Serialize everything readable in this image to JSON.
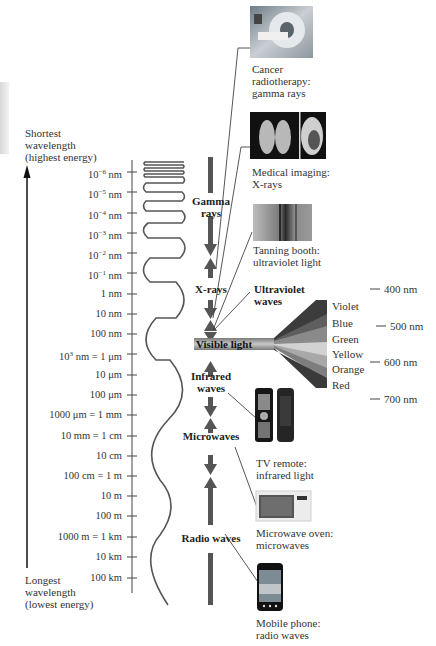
{
  "diagram": {
    "axis": {
      "top_label": [
        "Shortest",
        "wavelength",
        "(highest energy)"
      ],
      "bottom_label": [
        "Longest",
        "wavelength",
        "(lowest energy)"
      ],
      "ticks": [
        {
          "base": "10",
          "exp": "−6",
          "unit": " nm",
          "y": 172
        },
        {
          "base": "10",
          "exp": "−5",
          "unit": " nm",
          "y": 192
        },
        {
          "base": "10",
          "exp": "−4",
          "unit": " nm",
          "y": 213
        },
        {
          "base": "10",
          "exp": "−3",
          "unit": " nm",
          "y": 233
        },
        {
          "base": "10",
          "exp": "−2",
          "unit": " nm",
          "y": 253
        },
        {
          "base": "10",
          "exp": "−1",
          "unit": " nm",
          "y": 273
        },
        {
          "base": "1 nm",
          "exp": "",
          "unit": "",
          "y": 294
        },
        {
          "base": "10 nm",
          "exp": "",
          "unit": "",
          "y": 314
        },
        {
          "base": "100 nm",
          "exp": "",
          "unit": "",
          "y": 334
        },
        {
          "base": "10",
          "exp": "3",
          "unit": " nm = 1 μm",
          "y": 354
        },
        {
          "base": "10 μm",
          "exp": "",
          "unit": "",
          "y": 375
        },
        {
          "base": "100 μm",
          "exp": "",
          "unit": "",
          "y": 395
        },
        {
          "base": "1000 μm = 1 mm",
          "exp": "",
          "unit": "",
          "y": 415
        },
        {
          "base": "10 mm = 1 cm",
          "exp": "",
          "unit": "",
          "y": 436
        },
        {
          "base": "10 cm",
          "exp": "",
          "unit": "",
          "y": 456
        },
        {
          "base": "100 cm = 1 m",
          "exp": "",
          "unit": "",
          "y": 476
        },
        {
          "base": "10 m",
          "exp": "",
          "unit": "",
          "y": 496
        },
        {
          "base": "100 m",
          "exp": "",
          "unit": "",
          "y": 516
        },
        {
          "base": "1000 m = 1 km",
          "exp": "",
          "unit": "",
          "y": 537
        },
        {
          "base": "10 km",
          "exp": "",
          "unit": "",
          "y": 557
        },
        {
          "base": "100 km",
          "exp": "",
          "unit": "",
          "y": 578
        }
      ]
    },
    "bands": [
      {
        "name": "Gamma rays",
        "lines": [
          "Gamma",
          "rays"
        ]
      },
      {
        "name": "X-rays",
        "lines": [
          "X-rays"
        ]
      },
      {
        "name": "Ultraviolet waves",
        "lines": [
          "Ultraviolet",
          "waves"
        ]
      },
      {
        "name": "Visible light",
        "lines": [
          "Visible light"
        ]
      },
      {
        "name": "Infrared waves",
        "lines": [
          "Infrared",
          "waves"
        ]
      },
      {
        "name": "Microwaves",
        "lines": [
          "Microwaves"
        ]
      },
      {
        "name": "Radio waves",
        "lines": [
          "Radio waves"
        ]
      }
    ],
    "visible_spectrum": {
      "colors": [
        "Violet",
        "Blue",
        "Green",
        "Yellow",
        "Orange",
        "Red"
      ],
      "wavelength_marks": [
        "400 nm",
        "500 nm",
        "600 nm",
        "700 nm"
      ]
    },
    "examples": [
      {
        "image": "mri-machine-photo",
        "caption": [
          "Cancer",
          "radiotherapy:",
          "gamma rays"
        ]
      },
      {
        "image": "chest-xray-photo",
        "caption": [
          "Medical imaging:",
          "X-rays"
        ]
      },
      {
        "image": "tanning-booth-photo",
        "caption": [
          "Tanning booth:",
          "ultraviolet light"
        ]
      },
      {
        "image": "tv-remotes-photo",
        "caption": [
          "TV remote:",
          "infrared light"
        ]
      },
      {
        "image": "microwave-oven-photo",
        "caption": [
          "Microwave oven:",
          "microwaves"
        ]
      },
      {
        "image": "mobile-phone-photo",
        "caption": [
          "Mobile phone:",
          "radio waves"
        ]
      }
    ],
    "colors": {
      "text": "#333333",
      "arrow_gray": "#555555",
      "visible_bar": "#9a9a9a",
      "wave": "#555555"
    }
  }
}
